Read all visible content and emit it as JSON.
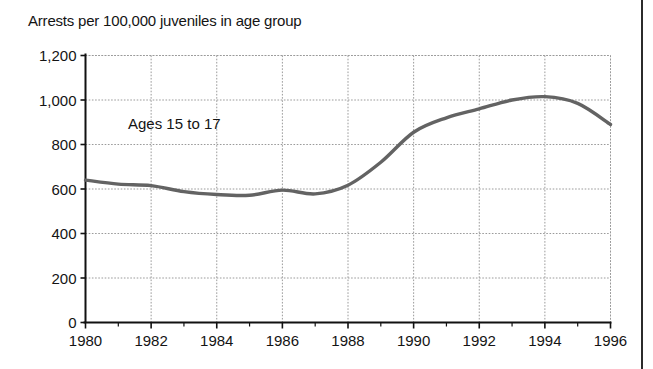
{
  "figure": {
    "title": "Arrests per 100,000 juveniles in age group",
    "background_color": "#ffffff",
    "page_edge_rule_color": "#2b2b2b"
  },
  "chart_data": {
    "type": "line",
    "title": "Arrests per 100,000 juveniles in age group",
    "xlabel": "",
    "ylabel": "",
    "xlim": [
      1980,
      1996
    ],
    "ylim": [
      0,
      1200
    ],
    "grid": true,
    "legend_position": "none",
    "x_tick_labels": [
      "1980",
      "1982",
      "1984",
      "1986",
      "1988",
      "1990",
      "1992",
      "1994",
      "1996"
    ],
    "x_ticks": [
      1980,
      1982,
      1984,
      1986,
      1988,
      1990,
      1992,
      1994,
      1996
    ],
    "x_minor_ticks": [
      1981,
      1983,
      1985,
      1987,
      1989,
      1991,
      1993,
      1995
    ],
    "y_tick_labels": [
      "0",
      "200",
      "400",
      "600",
      "800",
      "1,000",
      "1,200"
    ],
    "y_ticks": [
      0,
      200,
      400,
      600,
      800,
      1000,
      1200
    ],
    "series": [
      {
        "name": "Ages 15 to 17",
        "annotation": "Ages 15 to 17",
        "color": "#636363",
        "x": [
          1980,
          1981,
          1982,
          1983,
          1984,
          1985,
          1986,
          1987,
          1988,
          1989,
          1990,
          1991,
          1992,
          1993,
          1994,
          1995,
          1996
        ],
        "values": [
          640,
          622,
          615,
          588,
          575,
          572,
          595,
          578,
          617,
          720,
          855,
          920,
          960,
          1000,
          1015,
          985,
          890
        ]
      }
    ]
  },
  "annotations": {
    "series_label": "Ages 15 to 17"
  }
}
